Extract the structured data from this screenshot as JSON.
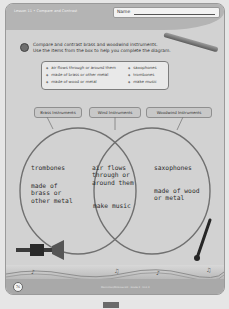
{
  "header": {
    "lesson": "Lesson 11 • Compare and Contrast",
    "name_label": "Name"
  },
  "instructions": {
    "line1": "Compare and contrast brass and woodwind instruments.",
    "line2": "Use the items from the box to help you complete the diagram."
  },
  "word_box": {
    "left_items": [
      "air flows through or around them",
      "made of brass or other metal",
      "made of wood or metal"
    ],
    "right_items": [
      "saxophones",
      "trombones",
      "make music"
    ]
  },
  "venn": {
    "labels": [
      "Brass Instruments",
      "Wind Instruments",
      "Woodwind Instruments"
    ],
    "left": {
      "item1": "trombones",
      "item2": "made of\nbrass or\nother metal"
    },
    "middle": {
      "item1": "air flows\nthrough or\naround them",
      "item2": "make music"
    },
    "right": {
      "item1": "saxophones",
      "item2": "made of wood\nor metal"
    }
  },
  "footer": {
    "page_number": "76",
    "note": "Macmillan/McGraw-Hill · Grade 3 · Unit 3"
  },
  "colors": {
    "page_bg": "#d2d2d2",
    "band": "#b4b4b4",
    "circle_stroke": "#707070"
  }
}
